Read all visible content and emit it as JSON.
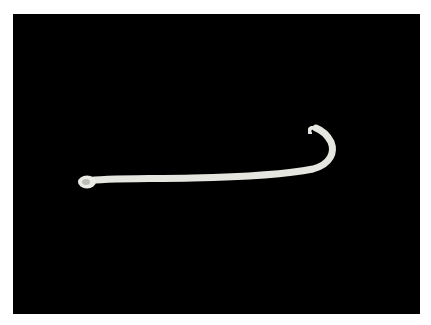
{
  "image": {
    "subject": "white nematode worm specimen on black background",
    "background_color": "#000000",
    "specimen_color": "#e8e8e2",
    "page_color": "#ffffff"
  }
}
